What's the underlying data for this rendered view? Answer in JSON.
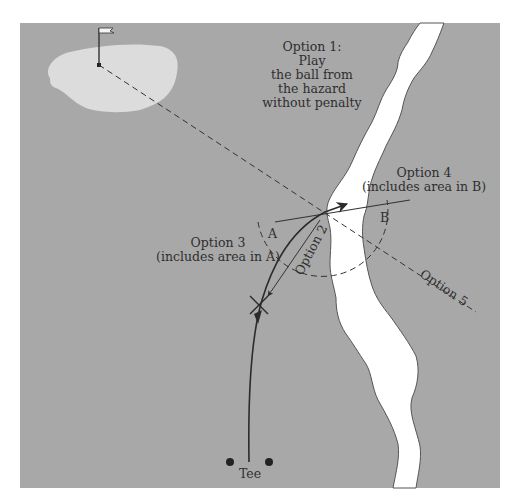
{
  "diagram": {
    "colors": {
      "fairway": "#a8a8a8",
      "green": "#dcdcdc",
      "hazard": "#ffffff",
      "line": "#333333",
      "background": "#ffffff"
    },
    "labels": {
      "option1": [
        "Option 1:",
        "Play",
        "the ball from",
        "the hazard",
        "without penalty"
      ],
      "option2": "Option 2",
      "option3": [
        "Option 3",
        "(includes area in A)"
      ],
      "option4": [
        "Option 4",
        "(includes area in B)"
      ],
      "option5": "Option 5",
      "area_a": "A",
      "area_b": "B",
      "tee": "Tee"
    },
    "elements": {
      "green": "putting green",
      "flag": "flagstick",
      "hazard": "lateral water hazard (river)",
      "ball_entry_point": "point where ball last crossed hazard margin",
      "drop_mark": "X"
    }
  }
}
